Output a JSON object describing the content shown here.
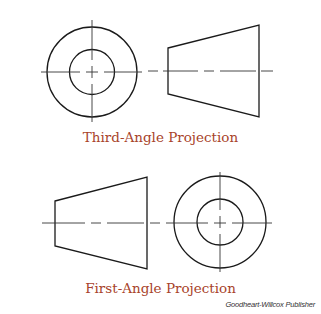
{
  "figures": [
    {
      "caption": "Third-Angle Projection",
      "order": [
        "circular-view",
        "trapezoid-view"
      ]
    },
    {
      "caption": "First-Angle Projection",
      "order": [
        "trapezoid-view",
        "circular-view"
      ]
    }
  ],
  "credit": "Goodheart-Willcox Publisher",
  "colors": {
    "caption": "#a8432a",
    "lines": "#1a1a1a"
  }
}
